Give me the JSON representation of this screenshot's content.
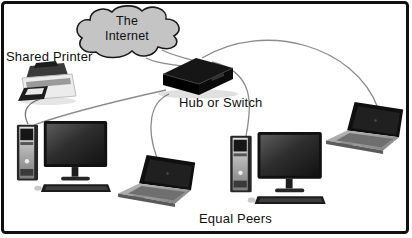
{
  "diagram": {
    "type": "network-topology",
    "labels": {
      "internet_line1": "The",
      "internet_line2": "Internet",
      "shared_printer": "Shared Printer",
      "hub_or_switch": "Hub or Switch",
      "equal_peers": "Equal Peers"
    },
    "nodes": [
      {
        "id": "internet-cloud",
        "label": "The Internet",
        "kind": "cloud"
      },
      {
        "id": "shared-printer",
        "label": "Shared Printer",
        "kind": "printer"
      },
      {
        "id": "hub-or-switch",
        "label": "Hub or Switch",
        "kind": "hub"
      },
      {
        "id": "desktop-pc-left",
        "label": "Equal Peer",
        "kind": "desktop"
      },
      {
        "id": "laptop-center",
        "label": "Equal Peer",
        "kind": "laptop"
      },
      {
        "id": "desktop-pc-right",
        "label": "Equal Peer",
        "kind": "desktop"
      },
      {
        "id": "laptop-right",
        "label": "Equal Peer",
        "kind": "laptop"
      }
    ],
    "edges": [
      {
        "from": "internet-cloud",
        "to": "hub-or-switch"
      },
      {
        "from": "shared-printer",
        "to": "desktop-pc-left"
      },
      {
        "from": "hub-or-switch",
        "to": "desktop-pc-left"
      },
      {
        "from": "hub-or-switch",
        "to": "laptop-center"
      },
      {
        "from": "hub-or-switch",
        "to": "desktop-pc-right"
      },
      {
        "from": "hub-or-switch",
        "to": "laptop-right"
      }
    ],
    "colors": {
      "background": "#ffffff",
      "frame": "#101010",
      "cloud_fill": "#c4c4c4",
      "cloud_stroke": "#1a1a1a",
      "cable": "#8c8c8c",
      "device_dark": "#141414",
      "text": "#111111"
    }
  }
}
